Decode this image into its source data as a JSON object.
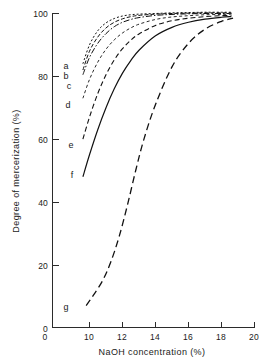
{
  "chart_data": {
    "type": "line",
    "title": "",
    "xlabel": "NaOH concentration (%)",
    "ylabel": "Degree of mercerization (%)",
    "xlim": [
      0,
      20
    ],
    "ylim": [
      0,
      100
    ],
    "xticks": [
      0,
      10,
      12,
      14,
      16,
      18,
      20
    ],
    "xtick_labels": [
      "0",
      "10",
      "12",
      "14",
      "16",
      "18",
      "20"
    ],
    "yticks": [
      0,
      20,
      40,
      60,
      80,
      100
    ],
    "ytick_labels": [
      "0",
      "20",
      "40",
      "60",
      "80",
      "100"
    ],
    "x_axis_break": true,
    "grid": false,
    "legend": "inline-curve-labels",
    "series": [
      {
        "name": "a",
        "label": "a",
        "linestyle": "dotted",
        "dasharray": "2,2",
        "width": 1,
        "x": [
          9.6,
          10,
          10.5,
          11,
          11.5,
          12,
          12.5,
          13,
          14,
          15,
          16,
          17,
          18,
          18.6
        ],
        "y": [
          84,
          90,
          94.5,
          97,
          98.4,
          99.2,
          99.6,
          99.8,
          100,
          100.2,
          100.3,
          100.4,
          100.4,
          100.4
        ]
      },
      {
        "name": "b",
        "label": "b",
        "linestyle": "dashed-short",
        "dasharray": "4,2",
        "width": 1,
        "x": [
          9.6,
          10,
          10.5,
          11,
          11.5,
          12,
          12.5,
          13,
          14,
          15,
          16,
          17,
          18,
          18.6
        ],
        "y": [
          82,
          88,
          92.5,
          95.4,
          97.2,
          98.3,
          99,
          99.4,
          99.8,
          100,
          100.1,
          100.2,
          100.2,
          100.2
        ]
      },
      {
        "name": "c",
        "label": "c",
        "linestyle": "dash-dot",
        "dasharray": "6,2,1.5,2",
        "width": 1,
        "x": [
          9.6,
          10,
          10.5,
          11,
          11.5,
          12,
          12.5,
          13,
          14,
          15,
          16,
          17,
          18,
          18.6
        ],
        "y": [
          80.5,
          86,
          90.5,
          93.6,
          95.8,
          97.2,
          98.1,
          98.7,
          99.4,
          99.7,
          99.9,
          100,
          100,
          100
        ]
      },
      {
        "name": "d",
        "label": "d",
        "linestyle": "dashed-fine",
        "dasharray": "3,2.5",
        "width": 0.9,
        "x": [
          9.6,
          10,
          10.5,
          11,
          11.5,
          12,
          12.5,
          13,
          14,
          15,
          16,
          17,
          18,
          18.6
        ],
        "y": [
          73,
          79,
          84.5,
          88.6,
          91.6,
          93.8,
          95.4,
          96.6,
          98.1,
          98.9,
          99.3,
          99.6,
          99.7,
          99.8
        ]
      },
      {
        "name": "e",
        "label": "e",
        "linestyle": "dashed-medium",
        "dasharray": "5,3",
        "width": 1.1,
        "x": [
          9.6,
          10,
          10.5,
          11,
          11.5,
          12,
          12.5,
          13,
          14,
          15,
          16,
          17,
          18,
          18.6
        ],
        "y": [
          60,
          67,
          74.5,
          80.5,
          85.2,
          88.8,
          91.5,
          93.5,
          96.2,
          97.7,
          98.5,
          99,
          99.3,
          99.4
        ]
      },
      {
        "name": "f",
        "label": "f",
        "linestyle": "solid",
        "dasharray": "none",
        "width": 1.2,
        "x": [
          9.6,
          10,
          10.5,
          11,
          11.5,
          12,
          12.5,
          13,
          14,
          15,
          16,
          17,
          18,
          18.6
        ],
        "y": [
          48,
          55,
          63,
          70,
          76,
          81,
          85,
          88.3,
          92.9,
          95.6,
          97.2,
          98.2,
          98.8,
          99
        ]
      },
      {
        "name": "g",
        "label": "g",
        "linestyle": "dashed-long",
        "dasharray": "7,4",
        "width": 1.3,
        "x": [
          9.8,
          10.2,
          10.8,
          11.3,
          11.8,
          12.3,
          12.8,
          13.3,
          14,
          15,
          16,
          17,
          18,
          18.7
        ],
        "y": [
          7,
          10,
          15,
          21,
          29,
          39,
          50,
          60,
          71,
          83,
          90.5,
          95,
          97.5,
          98.5
        ]
      }
    ],
    "curve_labels": [
      {
        "text": "a",
        "x_px": 66,
        "y_px": 69
      },
      {
        "text": "b",
        "x_px": 66,
        "y_px": 79
      },
      {
        "text": "c",
        "x_px": 69,
        "y_px": 89
      },
      {
        "text": "d",
        "x_px": 68,
        "y_px": 108
      },
      {
        "text": "e",
        "x_px": 71,
        "y_px": 148
      },
      {
        "text": "f",
        "x_px": 72,
        "y_px": 178
      },
      {
        "text": "g",
        "x_px": 66,
        "y_px": 310
      }
    ]
  }
}
